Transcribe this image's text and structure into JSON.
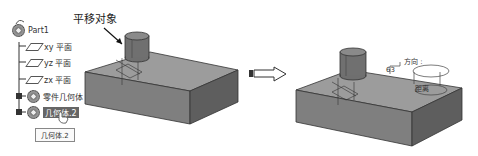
{
  "tree": {
    "root": "Part1",
    "items": [
      {
        "label": "xy 平面",
        "icon": "plane-icon"
      },
      {
        "label": "yz 平面",
        "icon": "plane-icon"
      },
      {
        "label": "zx 平面",
        "icon": "plane-icon"
      },
      {
        "label": "零件几何体",
        "icon": "gear-icon"
      },
      {
        "label": "几何体.2",
        "icon": "gear-icon",
        "selected": true
      }
    ],
    "tooltip": "几何体.2"
  },
  "left_model": {
    "callout": "平移对象"
  },
  "transition_arrow": "right-arrow-icon",
  "right_model": {
    "direction_label": "方向 :",
    "distance_label": "距离",
    "dimension_value": "63"
  },
  "colors": {
    "box_top": "#9a9a9a",
    "box_front": "#7e7e7e",
    "box_side": "#5f5f5f",
    "cylinder": "#6f6f6f",
    "selection": "#666666"
  }
}
